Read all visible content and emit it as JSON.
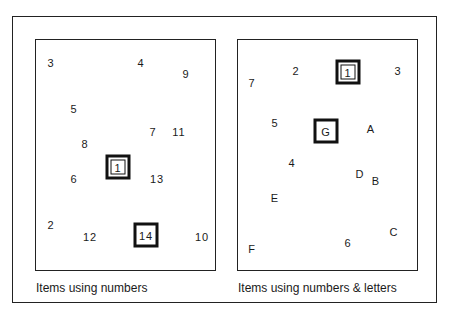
{
  "panels": [
    {
      "id": "left",
      "caption": "Items using numbers",
      "items": [
        {
          "label": "3",
          "x": 51,
          "y": 63,
          "box": "none"
        },
        {
          "label": "4",
          "x": 141,
          "y": 63,
          "box": "none"
        },
        {
          "label": "9",
          "x": 186,
          "y": 74,
          "box": "none"
        },
        {
          "label": "5",
          "x": 74,
          "y": 109,
          "box": "none"
        },
        {
          "label": "7",
          "x": 153,
          "y": 132,
          "box": "none"
        },
        {
          "label": "11",
          "x": 179,
          "y": 132,
          "box": "none"
        },
        {
          "label": "8",
          "x": 85,
          "y": 144,
          "box": "none"
        },
        {
          "label": "1",
          "x": 118,
          "y": 167,
          "box": "double"
        },
        {
          "label": "6",
          "x": 74,
          "y": 179,
          "box": "none"
        },
        {
          "label": "13",
          "x": 157,
          "y": 179,
          "box": "none"
        },
        {
          "label": "2",
          "x": 51,
          "y": 225,
          "box": "none"
        },
        {
          "label": "12",
          "x": 90,
          "y": 237,
          "box": "none"
        },
        {
          "label": "14",
          "x": 146,
          "y": 235,
          "box": "single"
        },
        {
          "label": "10",
          "x": 202,
          "y": 237,
          "box": "none"
        }
      ]
    },
    {
      "id": "right",
      "caption": "Items using numbers & letters",
      "items": [
        {
          "label": "7",
          "x": 252,
          "y": 83,
          "box": "none"
        },
        {
          "label": "2",
          "x": 296,
          "y": 71,
          "box": "none"
        },
        {
          "label": "1",
          "x": 348,
          "y": 72,
          "box": "double"
        },
        {
          "label": "3",
          "x": 398,
          "y": 71,
          "box": "none"
        },
        {
          "label": "5",
          "x": 275,
          "y": 123,
          "box": "none"
        },
        {
          "label": "G",
          "x": 326,
          "y": 131,
          "box": "single"
        },
        {
          "label": "A",
          "x": 371,
          "y": 129,
          "box": "none"
        },
        {
          "label": "4",
          "x": 292,
          "y": 163,
          "box": "none"
        },
        {
          "label": "D",
          "x": 360,
          "y": 174,
          "box": "none"
        },
        {
          "label": "B",
          "x": 376,
          "y": 181,
          "box": "none"
        },
        {
          "label": "E",
          "x": 275,
          "y": 198,
          "box": "none"
        },
        {
          "label": "C",
          "x": 394,
          "y": 232,
          "box": "none"
        },
        {
          "label": "6",
          "x": 348,
          "y": 243,
          "box": "none"
        },
        {
          "label": "F",
          "x": 252,
          "y": 249,
          "box": "none"
        }
      ]
    }
  ],
  "colors": {
    "stroke": "#111111",
    "background": "#ffffff",
    "text": "#1a1a1a"
  }
}
